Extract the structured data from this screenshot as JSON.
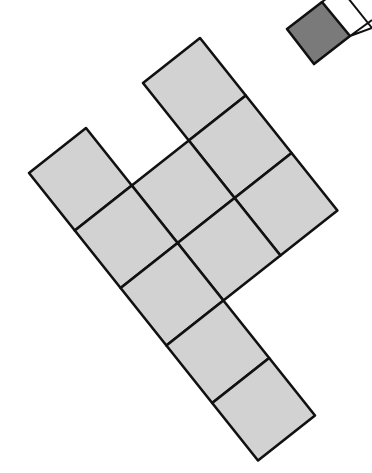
{
  "diagram": {
    "colors": {
      "cell_fill": "#d2d2d2",
      "stroke": "#111111",
      "shaded_fill": "#7a7a7a",
      "background": "#ffffff"
    },
    "grid": {
      "origin": [
        200,
        38
      ],
      "u": [
        45.8,
        57.5
      ],
      "v": [
        -57.0,
        45.0
      ]
    },
    "cells": [
      {
        "i": 0,
        "j": 0
      },
      {
        "i": 1,
        "j": 0
      },
      {
        "i": 2,
        "j": 0
      },
      {
        "i": 1,
        "j": 1
      },
      {
        "i": 2,
        "j": 1
      },
      {
        "i": 0,
        "j": 2
      },
      {
        "i": 1,
        "j": 2
      },
      {
        "i": 2,
        "j": 2
      },
      {
        "i": 3,
        "j": 2
      },
      {
        "i": 4,
        "j": 2
      }
    ],
    "reference": {
      "shaded_square": [
        [
          322,
          2
        ],
        [
          350,
          36
        ],
        [
          314,
          64
        ],
        [
          287,
          29
        ]
      ],
      "outline_square": [
        [
          350,
          36
        ],
        [
          372,
          20
        ],
        [
          372,
          70
        ],
        [
          350,
          36
        ]
      ]
    }
  }
}
